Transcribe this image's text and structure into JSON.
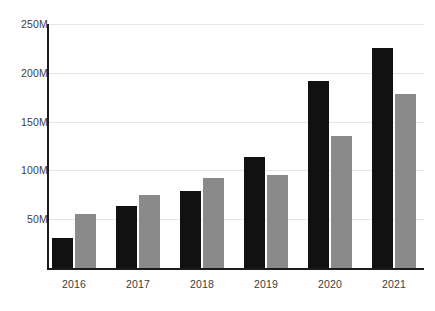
{
  "chart_data": {
    "type": "bar",
    "title": "",
    "subtitle": "",
    "xlabel": "",
    "ylabel": "",
    "categories": [
      "2016",
      "2017",
      "2018",
      "2019",
      "2020",
      "2021"
    ],
    "series": [
      {
        "name": "series-1",
        "color": "#111111",
        "values": [
          31,
          64,
          79,
          114,
          192,
          225
        ]
      },
      {
        "name": "series-2",
        "color": "#8a8a8a",
        "values": [
          55,
          75,
          92,
          95,
          135,
          178
        ]
      }
    ],
    "ylim": [
      0,
      250
    ],
    "yticks": [
      50,
      100,
      150,
      200,
      250
    ],
    "ytick_labels": [
      "50M",
      "100M",
      "150M",
      "200M",
      "250M"
    ],
    "unit_suffix": "M",
    "grid": true,
    "grid_color": "#e6e6e6",
    "legend": false,
    "legend_position": "none",
    "axis_color": "#1a1a1a",
    "tick_label_color": "#3c3c3c",
    "background": "#ffffff",
    "bar_width_px": 21,
    "group_pitch_px": 64
  }
}
